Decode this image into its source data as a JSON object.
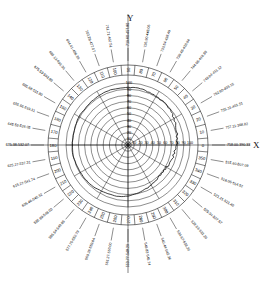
{
  "figure": {
    "type": "polar-diagram",
    "axis_x_label": "X",
    "axis_y_label": "Y",
    "background": "#ffffff",
    "line_color": "#000000"
  },
  "chart_data": {
    "type": "line",
    "title": "",
    "subtitle": "",
    "xlabel": "X",
    "ylabel": "Y",
    "coordinate_system": "polar",
    "grid": true,
    "legend_position": "none",
    "angular_axis": {
      "label": "",
      "unit": "degrees",
      "range": [
        0,
        360
      ],
      "tick_step": 10,
      "tick_labels": [
        "0",
        "10",
        "20",
        "30",
        "40",
        "50",
        "60",
        "70",
        "80",
        "90",
        "100",
        "110",
        "120",
        "130",
        "140",
        "150",
        "160",
        "170",
        "180",
        "190",
        "200",
        "210",
        "220",
        "230",
        "240",
        "250",
        "260",
        "270",
        "280",
        "290",
        "300",
        "310",
        "320",
        "330",
        "340",
        "350"
      ]
    },
    "radial_axis": {
      "label": "",
      "range": [
        0,
        100
      ],
      "tick_step": 10,
      "tick_labels": [
        "10",
        "20",
        "30",
        "40",
        "50",
        "60",
        "70",
        "80",
        "90",
        "100"
      ]
    },
    "center_tick_labels": [
      "10",
      "20",
      "30",
      "40",
      "50",
      "60",
      "70",
      "80",
      "90",
      "100"
    ],
    "outer_sector_labels": [
      "758.00-390.33",
      "757.11-368.82",
      "755.31-401.51",
      "752.60-403.15",
      "749.04-411.12",
      "744.66-419.80",
      "739.48-428.94",
      "733.54-438.40",
      "726.90-448.06",
      "719.60-457.80",
      "711.71-467.51",
      "703.29-477.07",
      "694.41-486.39",
      "685.13-495.36",
      "675.53-503.89",
      "665.68-511.90",
      "655.66-519.31",
      "645.53-526.05",
      "635.38-532.07",
      "625.27-537.31",
      "615.27-541.74",
      "605.46-545.32",
      "595.89-548.03",
      "586.64-549.86",
      "577.75-550.79",
      "569.28-550.84",
      "561.27-550.00",
      "553.77-548.29",
      "546.82-545.74",
      "540.44-542.36",
      "534.67-538.20",
      "529.53-533.29",
      "525.04-527.67",
      "521.21-521.40",
      "518.06-514.52",
      "515.60-507.09"
    ],
    "right_axis_labels": [
      "694.41-550.65",
      "694.00-550.71",
      "758.00-390.33",
      "757.11-368.82"
    ],
    "series": [
      {
        "name": "profile",
        "closed": true,
        "theta": [
          0,
          10,
          20,
          30,
          40,
          50,
          60,
          70,
          80,
          90,
          100,
          110,
          120,
          130,
          140,
          150,
          160,
          170,
          180,
          190,
          200,
          210,
          220,
          230,
          240,
          250,
          260,
          270,
          280,
          290,
          300,
          310,
          320,
          330,
          340,
          350
        ],
        "r": [
          78,
          80,
          83,
          86,
          88,
          90,
          91,
          92,
          93,
          93,
          93,
          93,
          92,
          92,
          91,
          91,
          90,
          90,
          90,
          90,
          89,
          89,
          88,
          87,
          86,
          85,
          84,
          82,
          80,
          77,
          74,
          72,
          71,
          72,
          74,
          76
        ]
      }
    ]
  }
}
